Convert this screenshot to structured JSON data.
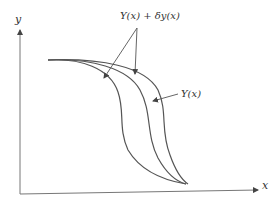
{
  "diagram": {
    "axes": {
      "x_label": "x",
      "y_label": "y"
    },
    "labels": {
      "varied_curve": "Y(x) + δy(x)",
      "true_curve": "Y(x)"
    },
    "colors": {
      "curve": "#555555",
      "axis": "#666666",
      "text": "#333333"
    }
  }
}
